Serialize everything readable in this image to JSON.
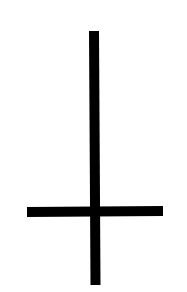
{
  "figure": {
    "symbol": "inverted-cross-icon",
    "background_color": "#ffffff",
    "stroke_color": "#000000",
    "vertical_bar": {
      "x1": 94,
      "y1": 31,
      "x2": 95.5,
      "y2": 285,
      "thickness": 10
    },
    "horizontal_bar": {
      "x1": 27,
      "y1": 212,
      "x2": 163,
      "y2": 211,
      "thickness": 10
    }
  }
}
